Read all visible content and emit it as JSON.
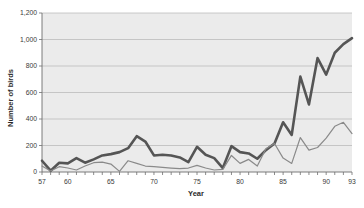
{
  "chart_data": {
    "type": "line",
    "title": "",
    "xlabel": "Year",
    "ylabel": "Number of birds",
    "xlim": [
      57,
      93
    ],
    "ylim": [
      0,
      1200
    ],
    "ytick_step": 200,
    "yticks": [
      0,
      200,
      400,
      600,
      800,
      1000,
      1200
    ],
    "ytick_labels": [
      "0",
      "200",
      "400",
      "600",
      "800",
      "1,000",
      "1,200"
    ],
    "xticks": [
      57,
      60,
      65,
      70,
      75,
      80,
      85,
      90,
      93
    ],
    "xtick_labels": [
      "57",
      "60",
      "65",
      "70",
      "75",
      "80",
      "85",
      "90",
      "93"
    ],
    "x_minor_tick_step": 1,
    "grid": "horizontal",
    "legend": "none",
    "plot_background": "#ebebeb",
    "grid_color": "#b4b4b4",
    "x": [
      57,
      58,
      59,
      60,
      61,
      62,
      63,
      64,
      65,
      66,
      67,
      68,
      69,
      70,
      71,
      72,
      73,
      74,
      75,
      76,
      77,
      78,
      79,
      80,
      81,
      82,
      83,
      84,
      85,
      86,
      87,
      88,
      89,
      90,
      91,
      92,
      93
    ],
    "series": [
      {
        "name": "thick-series",
        "color": "#555555",
        "width": 2.6,
        "values": [
          85,
          10,
          70,
          65,
          105,
          70,
          95,
          125,
          135,
          150,
          180,
          270,
          230,
          125,
          130,
          125,
          110,
          75,
          190,
          130,
          105,
          30,
          195,
          150,
          140,
          100,
          165,
          215,
          375,
          280,
          720,
          510,
          860,
          735,
          900,
          965,
          1010
        ]
      },
      {
        "name": "thin-series",
        "color": "#8a8a8a",
        "width": 1.2,
        "values": [
          45,
          8,
          40,
          30,
          15,
          45,
          70,
          75,
          60,
          5,
          85,
          65,
          45,
          40,
          35,
          30,
          25,
          30,
          50,
          30,
          15,
          20,
          125,
          65,
          95,
          45,
          175,
          215,
          105,
          65,
          260,
          165,
          185,
          255,
          345,
          375,
          290
        ]
      }
    ]
  }
}
